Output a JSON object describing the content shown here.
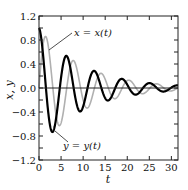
{
  "chart_data": {
    "type": "line",
    "title": "",
    "xlabel": "t",
    "ylabel": "x, y",
    "xlim": [
      0,
      31.5
    ],
    "ylim": [
      -1.2,
      1.2
    ],
    "xticks": [
      0,
      5,
      10,
      15,
      20,
      25,
      30
    ],
    "xtick_labels": [
      "0",
      "5",
      "10",
      "15",
      "20",
      "25",
      "30"
    ],
    "yticks": [
      -1.2,
      -0.8,
      -0.4,
      0.0,
      0.4,
      0.8,
      1.2
    ],
    "ytick_labels": [
      "−1.2",
      "−0.8",
      "−0.4",
      "0.0",
      "0.4",
      "0.8",
      "1.2"
    ],
    "yminor_step": 0.2,
    "grid": false,
    "zero_line": true,
    "legend": "none",
    "series": [
      {
        "name": "x = x(t)",
        "color": "#b0b0b0",
        "linewidth": 1.6,
        "model": "exp(-0.1 t) sin(t)",
        "x": [
          0,
          1.57,
          4.71,
          7.85,
          11.0,
          14.14,
          17.28,
          20.42,
          23.56,
          26.7,
          29.85,
          31.5
        ],
        "values": [
          0.0,
          0.85,
          -0.62,
          0.46,
          -0.33,
          0.24,
          -0.18,
          0.13,
          -0.1,
          0.07,
          -0.05,
          0.0
        ]
      },
      {
        "name": "y = y(t)",
        "color": "#000000",
        "linewidth": 2.2,
        "model": "exp(-0.1 t) cos(t)",
        "x": [
          0,
          3.14,
          6.28,
          9.42,
          12.57,
          15.71,
          18.85,
          21.99,
          25.13,
          28.27,
          31.5
        ],
        "values": [
          1.0,
          -0.73,
          0.53,
          -0.39,
          0.28,
          -0.21,
          0.15,
          -0.11,
          0.08,
          -0.06,
          0.04
        ]
      }
    ],
    "annotations": [
      {
        "text": "x = x(t)",
        "points_to_series": 0,
        "at_t": 1.9
      },
      {
        "text": "y = y(t)",
        "points_to_series": 1,
        "at_t": 3.1
      }
    ]
  }
}
